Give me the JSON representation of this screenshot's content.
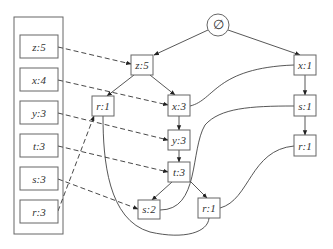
{
  "diagram": {
    "type": "tree-with-header-table",
    "root": {
      "id": "root",
      "label": "∅",
      "shape": "circle"
    },
    "header_table": {
      "items": [
        {
          "id": "h-z",
          "label": "z:5"
        },
        {
          "id": "h-x",
          "label": "x:4"
        },
        {
          "id": "h-y",
          "label": "y:3"
        },
        {
          "id": "h-t",
          "label": "t:3"
        },
        {
          "id": "h-s",
          "label": "s:3"
        },
        {
          "id": "h-r",
          "label": "r:3"
        }
      ]
    },
    "nodes": [
      {
        "id": "n-z5",
        "label": "z:5"
      },
      {
        "id": "n-r1a",
        "label": "r:1"
      },
      {
        "id": "n-x3",
        "label": "x:3"
      },
      {
        "id": "n-y3",
        "label": "y:3"
      },
      {
        "id": "n-t3",
        "label": "t:3"
      },
      {
        "id": "n-s2",
        "label": "s:2"
      },
      {
        "id": "n-r1b",
        "label": "r:1"
      },
      {
        "id": "n-x1",
        "label": "x:1"
      },
      {
        "id": "n-s1",
        "label": "s:1"
      },
      {
        "id": "n-r1c",
        "label": "r:1"
      }
    ],
    "tree_edges": [
      [
        "root",
        "n-z5"
      ],
      [
        "root",
        "n-x1"
      ],
      [
        "n-z5",
        "n-r1a"
      ],
      [
        "n-z5",
        "n-x3"
      ],
      [
        "n-x3",
        "n-y3"
      ],
      [
        "n-y3",
        "n-t3"
      ],
      [
        "n-t3",
        "n-s2"
      ],
      [
        "n-t3",
        "n-r1b"
      ],
      [
        "n-x1",
        "n-s1"
      ],
      [
        "n-s1",
        "n-r1c"
      ]
    ],
    "header_links": [
      [
        "h-z",
        "n-z5"
      ],
      [
        "h-x",
        "n-x3"
      ],
      [
        "h-y",
        "n-y3"
      ],
      [
        "h-t",
        "n-t3"
      ],
      [
        "h-s",
        "n-s2"
      ],
      [
        "h-r",
        "n-r1a"
      ]
    ],
    "node_links": [
      [
        "n-x3",
        "n-x1"
      ],
      [
        "n-s2",
        "n-s1"
      ],
      [
        "n-r1b",
        "n-r1c"
      ],
      [
        "n-r1a",
        "n-r1b"
      ]
    ]
  }
}
